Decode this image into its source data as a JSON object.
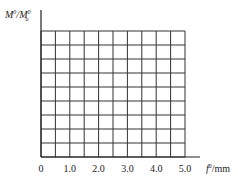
{
  "chart_data": {
    "type": "line",
    "title": "",
    "xlabel": "f°/mm",
    "ylabel": "M°/M°u",
    "x_ticks": [
      "0",
      "1.0",
      "2.0",
      "3.0",
      "4.0",
      "5.0"
    ],
    "y_ticks": [],
    "xlim": [
      0,
      5.0
    ],
    "grid": true,
    "grid_columns": 10,
    "grid_rows": 9,
    "series": [],
    "note": "Blank grid template; no data plotted"
  },
  "labels": {
    "y_main": "M",
    "y_sup1": "0",
    "y_sep": "/",
    "y_main2": "M",
    "y_sup2": "0",
    "y_sub2": "u",
    "x_var": "f",
    "x_sup": "0",
    "x_unit": "/mm"
  },
  "colors": {
    "grid": "#333333",
    "axis": "#222222",
    "background": "#ffffff"
  }
}
